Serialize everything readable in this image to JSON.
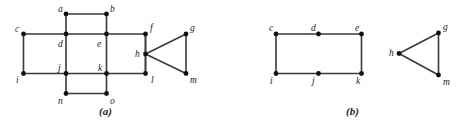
{
  "figure": {
    "background_color": "#ffffff",
    "edge_color": "#3a3a3a",
    "vertex_color": "#111111",
    "label_color": "#1c1c1c",
    "panels": [
      {
        "id": "panel-a",
        "caption": "(a)",
        "caption_pos": {
          "x": 99,
          "y": 106
        },
        "vertices": [
          {
            "id": "a",
            "label": "a",
            "x": 66,
            "y": 14,
            "label_x": 58,
            "label_y": 5
          },
          {
            "id": "b",
            "label": "b",
            "x": 106.5,
            "y": 14,
            "label_x": 110,
            "label_y": 5
          },
          {
            "id": "c",
            "label": "c",
            "x": 23.5,
            "y": 34,
            "label_x": 15,
            "label_y": 25
          },
          {
            "id": "d",
            "label": "d",
            "x": 66,
            "y": 34,
            "label_x": 58,
            "label_y": 40
          },
          {
            "id": "e",
            "label": "e",
            "x": 106.5,
            "y": 34,
            "label_x": 97,
            "label_y": 40
          },
          {
            "id": "f",
            "label": "f",
            "x": 145.5,
            "y": 34,
            "label_x": 150,
            "label_y": 24
          },
          {
            "id": "g",
            "label": "g",
            "x": 186,
            "y": 34,
            "label_x": 190,
            "label_y": 24
          },
          {
            "id": "h",
            "label": "h",
            "x": 145.5,
            "y": 54,
            "label_x": 135,
            "label_y": 50
          },
          {
            "id": "i",
            "label": "i",
            "x": 23.5,
            "y": 73.5,
            "label_x": 16,
            "label_y": 76
          },
          {
            "id": "j",
            "label": "j",
            "x": 66,
            "y": 73.5,
            "label_x": 58,
            "label_y": 64
          },
          {
            "id": "k",
            "label": "k",
            "x": 106.5,
            "y": 73.5,
            "label_x": 98,
            "label_y": 64
          },
          {
            "id": "l",
            "label": "l",
            "x": 145.5,
            "y": 73.5,
            "label_x": 151,
            "label_y": 76
          },
          {
            "id": "m",
            "label": "m",
            "x": 186,
            "y": 73.5,
            "label_x": 190,
            "label_y": 76
          },
          {
            "id": "n",
            "label": "n",
            "x": 66,
            "y": 93.5,
            "label_x": 58,
            "label_y": 97
          },
          {
            "id": "o",
            "label": "o",
            "x": 106.5,
            "y": 93.5,
            "label_x": 110,
            "label_y": 97
          }
        ],
        "edges": [
          [
            "a",
            "b"
          ],
          [
            "a",
            "d"
          ],
          [
            "b",
            "e"
          ],
          [
            "c",
            "d"
          ],
          [
            "d",
            "e"
          ],
          [
            "e",
            "f"
          ],
          [
            "c",
            "i"
          ],
          [
            "d",
            "j"
          ],
          [
            "e",
            "k"
          ],
          [
            "f",
            "h"
          ],
          [
            "f",
            "l"
          ],
          [
            "h",
            "l"
          ],
          [
            "h",
            "g"
          ],
          [
            "h",
            "m"
          ],
          [
            "g",
            "m"
          ],
          [
            "i",
            "j"
          ],
          [
            "j",
            "k"
          ],
          [
            "k",
            "l"
          ],
          [
            "j",
            "n"
          ],
          [
            "k",
            "o"
          ],
          [
            "n",
            "o"
          ]
        ]
      },
      {
        "id": "panel-b",
        "caption": "(b)",
        "caption_pos": {
          "x": 346,
          "y": 106
        },
        "vertices": [
          {
            "id": "c",
            "label": "c",
            "x": 276,
            "y": 34,
            "label_x": 269,
            "label_y": 24
          },
          {
            "id": "d",
            "label": "d",
            "x": 318.5,
            "y": 34,
            "label_x": 311,
            "label_y": 24
          },
          {
            "id": "e",
            "label": "e",
            "x": 361.5,
            "y": 34,
            "label_x": 355,
            "label_y": 24
          },
          {
            "id": "g",
            "label": "g",
            "x": 438.5,
            "y": 33,
            "label_x": 443,
            "label_y": 23
          },
          {
            "id": "h",
            "label": "h",
            "x": 399,
            "y": 53.5,
            "label_x": 389,
            "label_y": 49
          },
          {
            "id": "i",
            "label": "i",
            "x": 276,
            "y": 73.5,
            "label_x": 270,
            "label_y": 77
          },
          {
            "id": "j",
            "label": "j",
            "x": 318.5,
            "y": 73.5,
            "label_x": 312,
            "label_y": 77
          },
          {
            "id": "k",
            "label": "k",
            "x": 361.5,
            "y": 73.5,
            "label_x": 356,
            "label_y": 77
          },
          {
            "id": "m",
            "label": "m",
            "x": 438.5,
            "y": 75,
            "label_x": 443,
            "label_y": 78
          }
        ],
        "edges": [
          [
            "c",
            "d"
          ],
          [
            "d",
            "e"
          ],
          [
            "c",
            "i"
          ],
          [
            "e",
            "k"
          ],
          [
            "i",
            "j"
          ],
          [
            "j",
            "k"
          ],
          [
            "h",
            "g"
          ],
          [
            "h",
            "m"
          ],
          [
            "g",
            "m"
          ]
        ]
      }
    ]
  }
}
